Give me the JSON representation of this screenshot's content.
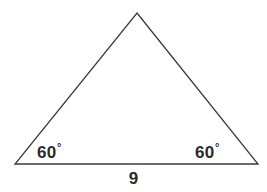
{
  "figure": {
    "kind": "geometry-diagram",
    "shape": "triangle",
    "background_color": "#ffffff",
    "stroke_color": "#3a3a3a",
    "text_color": "#2b2b2b",
    "stroke_width": 1.3,
    "vertices": {
      "apex": {
        "x": 137,
        "y": 13
      },
      "bottom_left": {
        "x": 15,
        "y": 164
      },
      "bottom_right": {
        "x": 258,
        "y": 164
      }
    },
    "labels": {
      "angle_left": {
        "value": "60",
        "degree_symbol": "°"
      },
      "angle_right": {
        "value": "60",
        "degree_symbol": "°"
      },
      "base_length": "9"
    }
  },
  "chart_data": {
    "type": "diagram",
    "title": "",
    "shape": "triangle",
    "annotations": [
      {
        "name": "angle-left",
        "text": "60°",
        "x": 38,
        "y": 152
      },
      {
        "name": "angle-right",
        "text": "60°",
        "x": 196,
        "y": 152
      },
      {
        "name": "base-length",
        "text": "9",
        "x": 133,
        "y": 180
      }
    ],
    "points": [
      {
        "name": "apex",
        "x": 137,
        "y": 13
      },
      {
        "name": "bottom-left",
        "x": 15,
        "y": 164
      },
      {
        "name": "bottom-right",
        "x": 258,
        "y": 164
      }
    ]
  }
}
